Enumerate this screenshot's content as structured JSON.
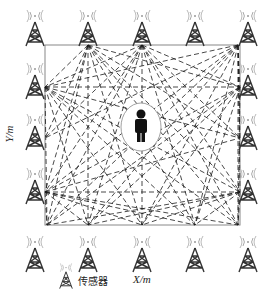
{
  "diagram": {
    "type": "sensor-network-localization",
    "x_axis_label": "X/m",
    "y_axis_label": "Y/m",
    "legend": {
      "icon": "antenna-tower-icon",
      "label": "传感器"
    },
    "center_object": "person-icon",
    "sensor_count": 16,
    "colors": {
      "line": "#1a1a1a",
      "tower": "#333333",
      "signal": "#aaaaaa",
      "box": "#888888"
    }
  }
}
